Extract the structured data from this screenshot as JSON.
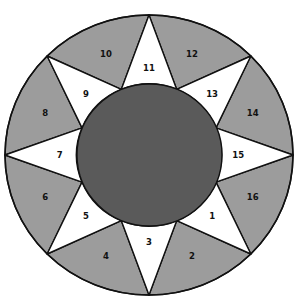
{
  "diagram": {
    "type": "circular-star-segment-diagram",
    "colors": {
      "gray_segment": "#9c9c9c",
      "white_segment": "#ffffff",
      "center_circle": "#5a5a5a",
      "stroke": "#111111"
    },
    "white_segments": [
      {
        "label": "11",
        "angle": -90
      },
      {
        "label": "13",
        "angle": -45
      },
      {
        "label": "15",
        "angle": 0
      },
      {
        "label": "1",
        "angle": 45
      },
      {
        "label": "3",
        "angle": 90
      },
      {
        "label": "5",
        "angle": 135
      },
      {
        "label": "7",
        "angle": 180
      },
      {
        "label": "9",
        "angle": 225
      }
    ],
    "gray_segments": [
      {
        "label": "12",
        "angle": -67.5
      },
      {
        "label": "14",
        "angle": -22.5
      },
      {
        "label": "16",
        "angle": 22.5
      },
      {
        "label": "2",
        "angle": 67.5
      },
      {
        "label": "4",
        "angle": 112.5
      },
      {
        "label": "6",
        "angle": 157.5
      },
      {
        "label": "8",
        "angle": 202.5
      },
      {
        "label": "10",
        "angle": 247.5
      }
    ]
  }
}
